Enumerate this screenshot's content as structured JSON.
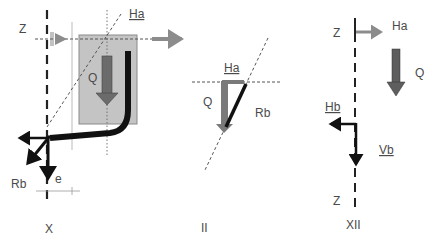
{
  "colors": {
    "background": "#ffffff",
    "box_fill": "#c4c4c4",
    "box_stroke": "#888888",
    "q_arrow": "#6b6b6b",
    "ha_arrow": "#8c8c8c",
    "heavy_line": "#111111",
    "dashed_line": "#555555",
    "text": "#4a4a4a"
  },
  "figure_X": {
    "caption": "X",
    "axis_label": "Z",
    "labels": {
      "ha": "Ha",
      "q": "Q",
      "rb": "Rb",
      "e": "e"
    }
  },
  "figure_II": {
    "caption": "II",
    "labels": {
      "ha": "Ha",
      "q": "Q",
      "rb": "Rb"
    }
  },
  "figure_XII": {
    "caption": "XII",
    "labels": {
      "z_top": "Z",
      "z_bottom": "Z",
      "ha": "Ha",
      "q": "Q",
      "hb": "Hb",
      "vb": "Vb"
    }
  }
}
